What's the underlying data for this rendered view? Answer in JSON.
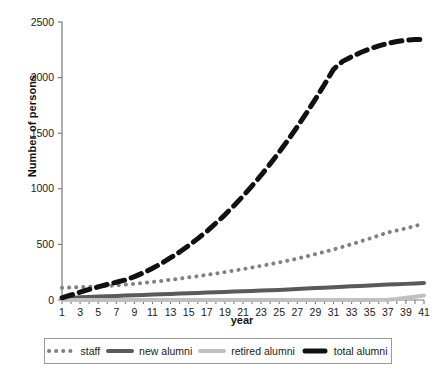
{
  "chart_data": {
    "type": "line",
    "title": "",
    "xlabel": "year",
    "ylabel": "Number of persons",
    "xlim": [
      1,
      41
    ],
    "ylim": [
      0,
      2500
    ],
    "yticks": [
      0,
      500,
      1000,
      1500,
      2000,
      2500
    ],
    "ytick_labels": [
      "0",
      "500",
      "1000",
      "1500",
      "2000",
      "2500"
    ],
    "xticks": [
      1,
      3,
      5,
      7,
      9,
      11,
      13,
      15,
      17,
      19,
      21,
      23,
      25,
      27,
      29,
      31,
      33,
      35,
      37,
      39,
      41
    ],
    "xtick_labels": [
      "1",
      "3",
      "5",
      "7",
      "9",
      "11",
      "13",
      "15",
      "17",
      "19",
      "21",
      "23",
      "25",
      "27",
      "29",
      "31",
      "33",
      "35",
      "37",
      "39",
      "41"
    ],
    "x": [
      1,
      2,
      3,
      4,
      5,
      6,
      7,
      8,
      9,
      10,
      11,
      12,
      13,
      14,
      15,
      16,
      17,
      18,
      19,
      20,
      21,
      22,
      23,
      24,
      25,
      26,
      27,
      28,
      29,
      30,
      31,
      32,
      33,
      34,
      35,
      36,
      37,
      38,
      39,
      40,
      41
    ],
    "grid": false,
    "legend_position": "below-axes",
    "series": [
      {
        "name": "staff",
        "style": "dotted",
        "color": "#808080",
        "width": 4,
        "values": [
          110,
          112,
          115,
          118,
          122,
          126,
          132,
          138,
          146,
          154,
          163,
          172,
          182,
          192,
          203,
          214,
          226,
          238,
          251,
          264,
          278,
          292,
          307,
          322,
          338,
          355,
          373,
          392,
          412,
          433,
          455,
          478,
          502,
          527,
          553,
          580,
          608,
          625,
          645,
          665,
          690
        ]
      },
      {
        "name": "new alumni",
        "style": "solid",
        "color": "#5a5a5a",
        "width": 4,
        "values": [
          10,
          18,
          24,
          28,
          31,
          34,
          37,
          40,
          43,
          46,
          49,
          52,
          55,
          58,
          61,
          64,
          67,
          70,
          73,
          76,
          79,
          82,
          85,
          88,
          91,
          95,
          99,
          103,
          107,
          111,
          115,
          119,
          123,
          127,
          131,
          135,
          139,
          142,
          145,
          148,
          152
        ]
      },
      {
        "name": "retired alumni",
        "style": "solid",
        "color": "#c0c0c0",
        "width": 4,
        "values": [
          0,
          0,
          0,
          0,
          0,
          0,
          0,
          0,
          0,
          0,
          0,
          0,
          0,
          0,
          0,
          0,
          0,
          0,
          0,
          0,
          0,
          0,
          0,
          0,
          0,
          0,
          0,
          0,
          0,
          0,
          0,
          0,
          0,
          0,
          0,
          0,
          2,
          10,
          20,
          30,
          40
        ]
      },
      {
        "name": "total alumni",
        "style": "dashed",
        "color": "#111111",
        "width": 5,
        "values": [
          20,
          45,
          70,
          95,
          118,
          140,
          160,
          180,
          210,
          245,
          285,
          330,
          380,
          432,
          490,
          552,
          618,
          690,
          766,
          848,
          934,
          1026,
          1122,
          1224,
          1330,
          1442,
          1558,
          1680,
          1806,
          1938,
          2074,
          2146,
          2188,
          2226,
          2258,
          2286,
          2308,
          2324,
          2336,
          2342,
          2345
        ]
      }
    ]
  },
  "axes": {
    "y_title": "Number of persons",
    "x_title": "year"
  },
  "legend": {
    "items": [
      {
        "label": "staff",
        "marker": "dotted-line-marker",
        "color": "#808080"
      },
      {
        "label": "new alumni",
        "marker": "solid-line-marker",
        "color": "#5a5a5a"
      },
      {
        "label": "retired alumni",
        "marker": "solid-line-marker",
        "color": "#c0c0c0"
      },
      {
        "label": "total alumni",
        "marker": "dashed-line-marker",
        "color": "#111111"
      }
    ]
  }
}
